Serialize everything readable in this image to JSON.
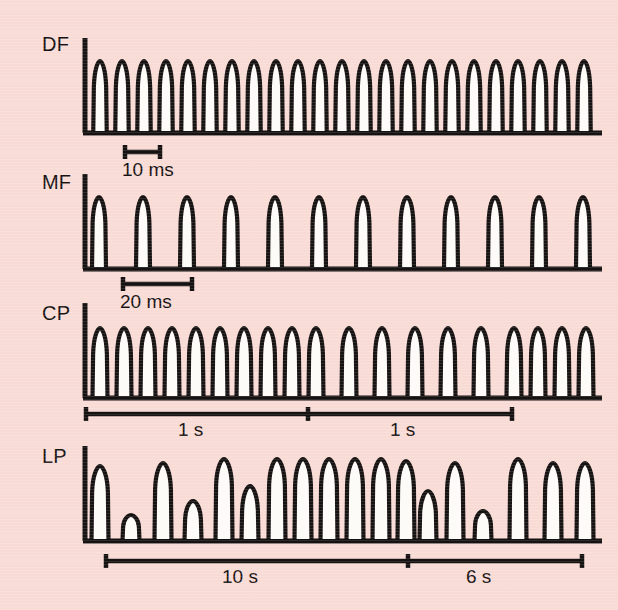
{
  "figure": {
    "background_color": "#f9dbd6",
    "ink_color": "#161212",
    "pulse_fill_color": "#fdfbf7",
    "width": 618,
    "height": 610
  },
  "traces": [
    {
      "id": "DF",
      "label": "DF",
      "description": "Dilator / fast pulse train, highest frequency, regular",
      "scalebar": {
        "label": "10 ms",
        "span_label": "10 ms"
      }
    },
    {
      "id": "MF",
      "label": "MF",
      "description": "Medium frequency pulse train, regular, half the rate of DF",
      "scalebar": {
        "label": "20 ms",
        "span_label": "20 ms"
      }
    },
    {
      "id": "CP",
      "label": "CP",
      "description": "Constrictor pulse train, dense burst then sparser pulses",
      "scalebar": {
        "labels": [
          "1 s",
          "1 s"
        ]
      }
    },
    {
      "id": "LP",
      "label": "LP",
      "description": "Slow pulse train with irregular amplitudes",
      "scalebar": {
        "labels": [
          "10 s",
          "6 s"
        ]
      }
    }
  ],
  "chart_data": {
    "type": "line",
    "title": "",
    "xlabel": "",
    "ylabel": "",
    "grid": false,
    "legend": "none",
    "series": [
      {
        "name": "DF",
        "row_label": "DF",
        "baseline_y": 133,
        "axis_x": 85,
        "axis_x_end": 602,
        "pulse_count": 23,
        "pulse_period_px": 22.0,
        "pulse_first_center_px": 100,
        "pulse_width_px": 13.5,
        "pulse_heights_px": [
          72,
          72,
          72,
          72,
          72,
          72,
          72,
          72,
          72,
          72,
          72,
          72,
          72,
          72,
          72,
          72,
          72,
          72,
          72,
          72,
          72,
          72,
          72
        ],
        "scalebar": {
          "x_start": 125,
          "x_end": 160,
          "y": 152,
          "label": "10 ms",
          "label_x": 126,
          "label_y": 163
        }
      },
      {
        "name": "MF",
        "row_label": "MF",
        "baseline_y": 269,
        "axis_x": 85,
        "axis_x_end": 602,
        "pulse_count": 12,
        "pulse_period_px": 44.0,
        "pulse_first_center_px": 99,
        "pulse_width_px": 14,
        "pulse_heights_px": [
          72,
          72,
          72,
          72,
          72,
          72,
          72,
          72,
          72,
          72,
          72,
          72
        ],
        "scalebar": {
          "x_start": 123,
          "x_end": 192,
          "y": 284,
          "label": "20 ms",
          "label_x": 124,
          "label_y": 295
        }
      },
      {
        "name": "CP",
        "row_label": "CP",
        "baseline_y": 398,
        "axis_x": 85,
        "axis_x_end": 602,
        "pulse_count": 20,
        "pulse_width_px": 15,
        "pulse_centers_px": [
          100,
          124,
          148,
          172,
          196,
          220,
          244,
          268,
          292,
          316,
          349,
          382,
          415,
          448,
          481,
          514,
          538,
          562,
          586
        ],
        "pulse_heights_px": [
          70,
          70,
          70,
          70,
          70,
          70,
          70,
          70,
          70,
          70,
          70,
          70,
          70,
          70,
          70,
          70,
          70,
          70,
          70
        ],
        "scalebar": {
          "x_start": 86,
          "x_end": 512,
          "y": 414,
          "tick_x": 308,
          "labels": [
            {
              "text": "1 s",
              "x": 182,
              "y": 424
            },
            {
              "text": "1 s",
              "x": 394,
              "y": 424
            }
          ]
        }
      },
      {
        "name": "LP",
        "row_label": "LP",
        "baseline_y": 541,
        "axis_x": 85,
        "axis_x_end": 602,
        "pulse_count": 19,
        "pulse_width_px": 17,
        "pulse_centers_px": [
          100,
          131,
          163,
          193,
          224,
          250,
          277,
          303,
          329,
          355,
          381,
          406,
          428,
          455,
          483,
          518,
          553,
          585
        ],
        "pulse_heights_px": [
          75,
          26,
          78,
          40,
          82,
          55,
          82,
          82,
          82,
          82,
          82,
          80,
          50,
          78,
          30,
          82,
          78,
          78,
          78
        ],
        "scalebar": {
          "x_start": 106,
          "x_end": 582,
          "y": 561,
          "tick_x": 408,
          "labels": [
            {
              "text": "10 s",
              "x": 228,
              "y": 571
            },
            {
              "text": "6 s",
              "x": 472,
              "y": 571
            }
          ]
        }
      }
    ]
  }
}
